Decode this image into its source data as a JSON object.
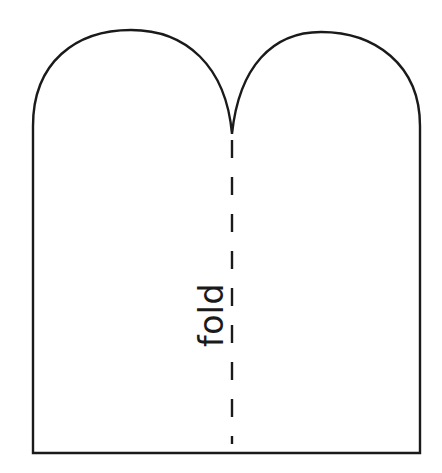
{
  "canvas": {
    "width": 442,
    "height": 473,
    "background_color": "#ffffff"
  },
  "figure": {
    "outline_color": "#1a1a1a",
    "outline_width": 2.4,
    "fill_color": "#ffffff"
  },
  "fold_line": {
    "label": "fold",
    "color": "#1a1a1a",
    "width": 2.4,
    "dash_length": 18,
    "gap_length": 19,
    "x": 232,
    "y_top": 140,
    "y_bottom": 444,
    "label_rotation_deg": -90,
    "label_color": "#1a1a1a",
    "label_x": 213,
    "label_y": 315
  },
  "geometry": {
    "left_edge_x": 33,
    "right_edge_x": 420,
    "bottom_edge_y": 453,
    "straight_side_top_y": 126,
    "left_arch_apex": [
      131,
      30
    ],
    "right_arch_apex": [
      321,
      32
    ],
    "notch_tip": [
      232,
      134
    ]
  }
}
